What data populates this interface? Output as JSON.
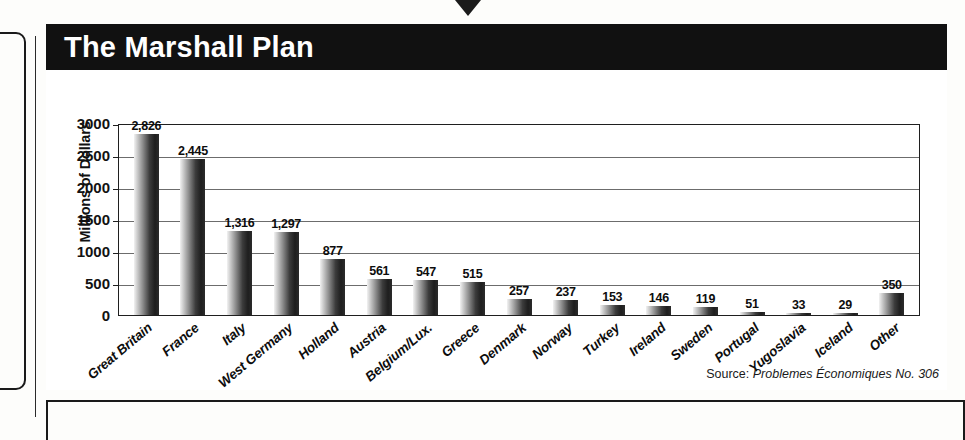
{
  "figure": {
    "title": "The Marshall Plan",
    "source_label": "Source:",
    "source_text": "Problemes Économiques No. 306"
  },
  "chart_data": {
    "type": "bar",
    "title": "The Marshall Plan",
    "xlabel": "",
    "ylabel": "Millions of Dollars",
    "ylim": [
      0,
      3000
    ],
    "yticks": [
      3000,
      2500,
      2000,
      1500,
      1000,
      500,
      0
    ],
    "ytick_labels": [
      "3000",
      "2500",
      "2000",
      "1500",
      "1000",
      "500",
      "0"
    ],
    "grid": true,
    "legend": false,
    "bar_color": "#2b2b2b",
    "categories": [
      "Great Britain",
      "France",
      "Italy",
      "West Germany",
      "Holland",
      "Austria",
      "Belgium/Lux.",
      "Greece",
      "Denmark",
      "Norway",
      "Turkey",
      "Ireland",
      "Sweden",
      "Portugal",
      "Yugoslavia",
      "Iceland",
      "Other"
    ],
    "values": [
      2826,
      2445,
      1316,
      1297,
      877,
      561,
      547,
      515,
      257,
      237,
      153,
      146,
      119,
      51,
      33,
      29,
      350
    ],
    "value_labels": [
      "2,826",
      "2,445",
      "1,316",
      "1,297",
      "877",
      "561",
      "547",
      "515",
      "257",
      "237",
      "153",
      "146",
      "119",
      "51",
      "33",
      "29",
      "350"
    ],
    "annotations": [
      "Source: Problemes Économiques No. 306"
    ]
  }
}
